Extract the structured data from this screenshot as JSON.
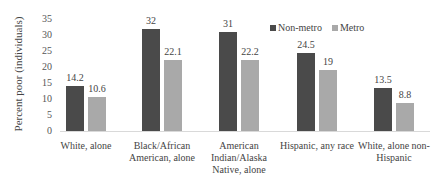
{
  "chart_data": {
    "type": "bar",
    "title": "",
    "xlabel": "",
    "ylabel": "Percent poor (individuals)",
    "ylim": [
      0,
      35
    ],
    "yticks": [
      0,
      5,
      10,
      15,
      20,
      25,
      30,
      35
    ],
    "grid": false,
    "legend_position": "top-right",
    "categories": [
      "White, alone",
      "Black/African American, alone",
      "American Indian/Alaska Native, alone",
      "Hispanic, any race",
      "White, alone non-Hispanic"
    ],
    "series": [
      {
        "name": "Non-metro",
        "color": "#4a4a4a",
        "values": [
          14.2,
          32,
          31,
          24.5,
          13.5
        ]
      },
      {
        "name": "Metro",
        "color": "#a9a9a9",
        "values": [
          10.6,
          22.1,
          22.2,
          19,
          8.8
        ]
      }
    ],
    "value_labels": [
      [
        "14.2",
        "32",
        "31",
        "24.5",
        "13.5"
      ],
      [
        "10.6",
        "22.1",
        "22.2",
        "19",
        "8.8"
      ]
    ],
    "category_lines": [
      [
        "White, alone"
      ],
      [
        "Black/African",
        "American, alone"
      ],
      [
        "American",
        "Indian/Alaska",
        "Native, alone"
      ],
      [
        "Hispanic, any race"
      ],
      [
        "White, alone non-",
        "Hispanic"
      ]
    ]
  }
}
